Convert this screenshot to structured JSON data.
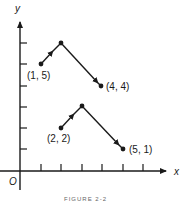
{
  "figure": {
    "axis_labels": {
      "x": "x",
      "y": "y",
      "origin": "O"
    },
    "caption": "FIGURE 2-2",
    "points": [
      {
        "label": "(1, 5)",
        "x": 1,
        "y": 5
      },
      {
        "label": "(4, 4)",
        "x": 4,
        "y": 4
      },
      {
        "label": "(2, 2)",
        "x": 2,
        "y": 2
      },
      {
        "label": "(5, 1)",
        "x": 5,
        "y": 1
      }
    ],
    "paths": [
      {
        "name": "upper-path",
        "vertices": [
          [
            1,
            5
          ],
          [
            2,
            6
          ],
          [
            4,
            4
          ]
        ]
      },
      {
        "name": "lower-path",
        "vertices": [
          [
            2,
            2
          ],
          [
            3,
            3
          ],
          [
            5,
            1
          ]
        ]
      }
    ],
    "x_ticks": [
      1,
      2,
      3,
      4,
      5,
      6
    ],
    "y_ticks": [
      1,
      2,
      3,
      4,
      5,
      6
    ],
    "color": "#1a1a1a"
  }
}
